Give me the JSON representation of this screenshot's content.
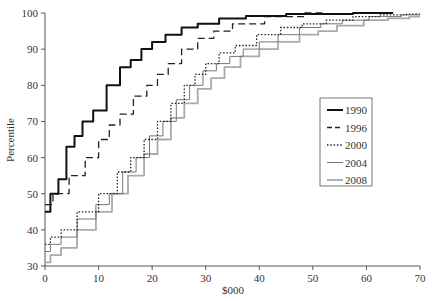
{
  "chart_data": {
    "type": "line",
    "title": "",
    "xlabel": "$000",
    "ylabel": "Percentile",
    "xlim": [
      0,
      70
    ],
    "ylim": [
      30,
      100
    ],
    "x_ticks": [
      0,
      10,
      20,
      30,
      40,
      50,
      60,
      70
    ],
    "y_ticks": [
      30,
      40,
      50,
      60,
      70,
      80,
      90,
      100
    ],
    "grid": false,
    "legend_position": "right-center (inside plot)",
    "series": [
      {
        "name": "1990",
        "style": "solid",
        "color": "#111111",
        "width": 2,
        "points": [
          [
            0,
            45
          ],
          [
            2,
            50
          ],
          [
            3,
            54
          ],
          [
            5,
            63
          ],
          [
            6,
            66
          ],
          [
            8,
            70
          ],
          [
            10,
            73
          ],
          [
            13,
            80
          ],
          [
            15,
            85
          ],
          [
            17,
            87
          ],
          [
            19,
            90
          ],
          [
            21,
            92
          ],
          [
            24,
            94
          ],
          [
            27,
            96
          ],
          [
            30,
            97
          ],
          [
            35,
            98.5
          ],
          [
            40,
            99.2
          ],
          [
            50,
            99.7
          ],
          [
            65,
            100
          ]
        ]
      },
      {
        "name": "1996",
        "style": "dashed",
        "color": "#222222",
        "width": 1.3,
        "points": [
          [
            0,
            47
          ],
          [
            3,
            50
          ],
          [
            6,
            55
          ],
          [
            9,
            60
          ],
          [
            11,
            65
          ],
          [
            13,
            69
          ],
          [
            15,
            72
          ],
          [
            18,
            77
          ],
          [
            20,
            80
          ],
          [
            22,
            83
          ],
          [
            24,
            86
          ],
          [
            27,
            90
          ],
          [
            30,
            93
          ],
          [
            33,
            95
          ],
          [
            37,
            97
          ],
          [
            45,
            99
          ],
          [
            52,
            100
          ]
        ]
      },
      {
        "name": "2000",
        "style": "dotted",
        "color": "#222222",
        "width": 1.3,
        "points": [
          [
            0,
            36
          ],
          [
            2,
            38
          ],
          [
            4,
            40
          ],
          [
            8,
            45
          ],
          [
            12,
            50
          ],
          [
            15,
            56
          ],
          [
            17,
            60
          ],
          [
            20,
            65
          ],
          [
            22,
            70
          ],
          [
            25,
            75
          ],
          [
            27,
            80
          ],
          [
            29,
            83
          ],
          [
            31,
            86
          ],
          [
            34,
            89
          ],
          [
            37,
            91
          ],
          [
            42,
            94
          ],
          [
            46,
            96
          ],
          [
            50,
            97
          ],
          [
            55,
            98
          ],
          [
            60,
            99
          ],
          [
            65,
            99.5
          ],
          [
            70,
            99.7
          ]
        ]
      },
      {
        "name": "2004",
        "style": "solid-thin",
        "color": "#777777",
        "width": 1,
        "points": [
          [
            0,
            34
          ],
          [
            2,
            36
          ],
          [
            4,
            38
          ],
          [
            8,
            43
          ],
          [
            11,
            47
          ],
          [
            13,
            50
          ],
          [
            16,
            56
          ],
          [
            18,
            60
          ],
          [
            21,
            66
          ],
          [
            23,
            70
          ],
          [
            26,
            76
          ],
          [
            28,
            80
          ],
          [
            31,
            84
          ],
          [
            33,
            86
          ],
          [
            36,
            88
          ],
          [
            38,
            90
          ],
          [
            42,
            92
          ],
          [
            45,
            94
          ],
          [
            50,
            96
          ],
          [
            53,
            97
          ],
          [
            58,
            98
          ],
          [
            63,
            99
          ],
          [
            70,
            99.5
          ]
        ]
      },
      {
        "name": "2008",
        "style": "solid-grey",
        "color": "#aaaaaa",
        "width": 1.8,
        "points": [
          [
            0,
            31
          ],
          [
            2,
            33
          ],
          [
            4,
            35
          ],
          [
            8,
            40
          ],
          [
            11,
            45
          ],
          [
            14,
            50
          ],
          [
            17,
            55
          ],
          [
            20,
            61
          ],
          [
            22,
            65
          ],
          [
            25,
            71
          ],
          [
            27,
            75
          ],
          [
            30,
            79
          ],
          [
            32,
            82
          ],
          [
            35,
            85
          ],
          [
            38,
            88
          ],
          [
            42,
            90
          ],
          [
            45,
            92
          ],
          [
            50,
            94
          ],
          [
            52,
            95
          ],
          [
            57,
            96.5
          ],
          [
            62,
            98
          ],
          [
            66,
            98.5
          ],
          [
            70,
            99
          ]
        ]
      }
    ]
  }
}
